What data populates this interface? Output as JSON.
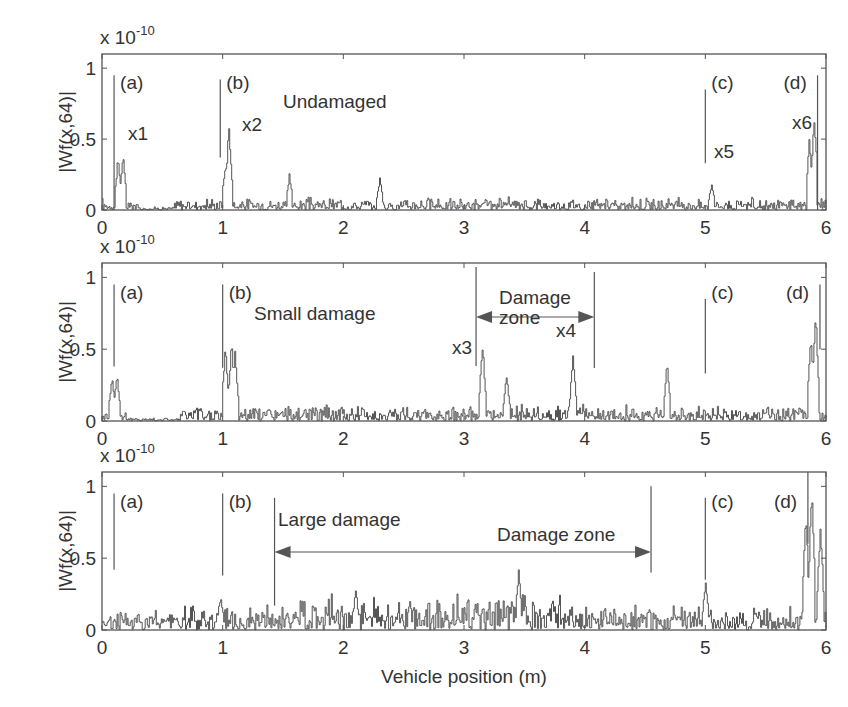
{
  "chart_data": [
    {
      "type": "line",
      "panel": "Undamaged",
      "title": "Undamaged",
      "xlabel": "",
      "ylabel": "|Wf(x,64)|",
      "y_multiplier": "x 10^-10",
      "xlim": [
        0,
        6
      ],
      "ylim": [
        0,
        1.1
      ],
      "xticks": [
        "0",
        "1",
        "2",
        "3",
        "4",
        "5",
        "6"
      ],
      "yticks": [
        "0",
        "0.5",
        "1"
      ],
      "grid": false,
      "markers": [
        {
          "label": "(a)",
          "x": 0.1,
          "y_top": 0.95,
          "y_bottom": 0.0
        },
        {
          "label": "(b)",
          "x": 0.98,
          "y_top": 0.92,
          "y_bottom": 0.37
        },
        {
          "label": "(c)",
          "x": 5.0,
          "y_top": 0.85,
          "y_bottom": 0.33
        },
        {
          "label": "(d)",
          "x": 5.93,
          "y_top": 0.95,
          "y_bottom": 0.0
        }
      ],
      "annotations": [
        "x1",
        "x2",
        "x5",
        "x6"
      ],
      "peaks": [
        {
          "x": 0.13,
          "y": 0.38
        },
        {
          "x": 0.17,
          "y": 0.41
        },
        {
          "x": 1.02,
          "y": 0.35
        },
        {
          "x": 1.05,
          "y": 0.63
        },
        {
          "x": 1.55,
          "y": 0.26
        },
        {
          "x": 2.3,
          "y": 0.24
        },
        {
          "x": 5.05,
          "y": 0.2
        },
        {
          "x": 5.86,
          "y": 0.52
        },
        {
          "x": 5.9,
          "y": 0.72
        }
      ],
      "baseline_noise": 0.08
    },
    {
      "type": "line",
      "panel": "Small damage",
      "title": "Small damage",
      "xlabel": "",
      "ylabel": "|Wf(x,64)|",
      "y_multiplier": "x 10^-10",
      "xlim": [
        0,
        6
      ],
      "ylim": [
        0,
        1.1
      ],
      "xticks": [
        "0",
        "1",
        "2",
        "3",
        "4",
        "5",
        "6"
      ],
      "yticks": [
        "0",
        "0.5",
        "1"
      ],
      "grid": false,
      "markers": [
        {
          "label": "(a)",
          "x": 0.1,
          "y_top": 0.95,
          "y_bottom": 0.38
        },
        {
          "label": "(b)",
          "x": 1.0,
          "y_top": 0.95,
          "y_bottom": 0.37
        },
        {
          "label": "(c)",
          "x": 5.0,
          "y_top": 0.85,
          "y_bottom": 0.33
        },
        {
          "label": "(d)",
          "x": 5.95,
          "y_top": 0.95,
          "y_bottom": 0.5
        }
      ],
      "damage_zone": {
        "label": "Damage zone",
        "x_start": 3.1,
        "x_end": 4.08
      },
      "annotations": [
        "x3",
        "x4"
      ],
      "peaks": [
        {
          "x": 0.08,
          "y": 0.32
        },
        {
          "x": 0.12,
          "y": 0.34
        },
        {
          "x": 1.02,
          "y": 0.55
        },
        {
          "x": 1.07,
          "y": 0.58
        },
        {
          "x": 1.1,
          "y": 0.5
        },
        {
          "x": 3.15,
          "y": 0.56
        },
        {
          "x": 3.35,
          "y": 0.35
        },
        {
          "x": 3.9,
          "y": 0.48
        },
        {
          "x": 4.68,
          "y": 0.43
        },
        {
          "x": 5.87,
          "y": 0.65
        },
        {
          "x": 5.91,
          "y": 0.82
        }
      ],
      "baseline_noise": 0.1
    },
    {
      "type": "line",
      "panel": "Large damage",
      "title": "Large damage",
      "xlabel": "Vehicle position (m)",
      "ylabel": "|Wf(x,64)|",
      "y_multiplier": "x 10^-10",
      "xlim": [
        0,
        6
      ],
      "ylim": [
        0,
        1.1
      ],
      "xticks": [
        "0",
        "1",
        "2",
        "3",
        "4",
        "5",
        "6"
      ],
      "yticks": [
        "0",
        "0.5",
        "1"
      ],
      "grid": false,
      "markers": [
        {
          "label": "(a)",
          "x": 0.1,
          "y_top": 0.95,
          "y_bottom": 0.42
        },
        {
          "label": "(b)",
          "x": 1.0,
          "y_top": 0.95,
          "y_bottom": 0.38
        },
        {
          "label": "(c)",
          "x": 5.0,
          "y_top": 0.92,
          "y_bottom": 0.35
        },
        {
          "label": "(d)",
          "x": 5.85,
          "y_top": 1.1,
          "y_bottom": 0.6
        }
      ],
      "damage_zone": {
        "label": "Damage zone",
        "x_start": 1.43,
        "x_end": 4.55
      },
      "peaks": [
        {
          "x": 0.98,
          "y": 0.25
        },
        {
          "x": 2.1,
          "y": 0.29
        },
        {
          "x": 3.45,
          "y": 0.44
        },
        {
          "x": 5.0,
          "y": 0.37
        },
        {
          "x": 5.83,
          "y": 0.85
        },
        {
          "x": 5.88,
          "y": 1.1
        },
        {
          "x": 5.95,
          "y": 0.8
        }
      ],
      "baseline_noise": 0.15
    }
  ],
  "figure": {
    "y_exponent_base": "x 10",
    "y_exponent_power": "-10",
    "x_axis_title": "Vehicle position (m)",
    "y_axis_title": "|Wf(x,64)|",
    "line_color": "#555555",
    "frame_color": "#555555"
  }
}
